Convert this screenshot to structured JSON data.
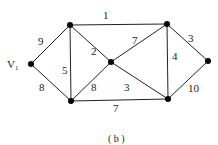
{
  "graph": {
    "caption": "( b )",
    "nodes": [
      {
        "id": "V1",
        "label": "V",
        "sub": "1",
        "x": 31,
        "y": 64
      },
      {
        "id": "A",
        "x": 70,
        "y": 25
      },
      {
        "id": "B",
        "x": 71,
        "y": 101
      },
      {
        "id": "C",
        "x": 111,
        "y": 62
      },
      {
        "id": "D",
        "x": 167,
        "y": 24
      },
      {
        "id": "E",
        "x": 168,
        "y": 99
      },
      {
        "id": "F",
        "x": 208,
        "y": 61
      }
    ],
    "edges": [
      {
        "from": "V1",
        "to": "A",
        "weight": "9"
      },
      {
        "from": "V1",
        "to": "B",
        "weight": "8"
      },
      {
        "from": "A",
        "to": "B",
        "weight": "5"
      },
      {
        "from": "A",
        "to": "C",
        "weight": "2"
      },
      {
        "from": "A",
        "to": "D",
        "weight": "1"
      },
      {
        "from": "C",
        "to": "B",
        "weight": "8"
      },
      {
        "from": "C",
        "to": "D",
        "weight": "7"
      },
      {
        "from": "C",
        "to": "E",
        "weight": "3"
      },
      {
        "from": "B",
        "to": "E",
        "weight": "7"
      },
      {
        "from": "D",
        "to": "E",
        "weight": "4"
      },
      {
        "from": "D",
        "to": "F",
        "weight": "3"
      },
      {
        "from": "E",
        "to": "F",
        "weight": "10"
      }
    ]
  }
}
